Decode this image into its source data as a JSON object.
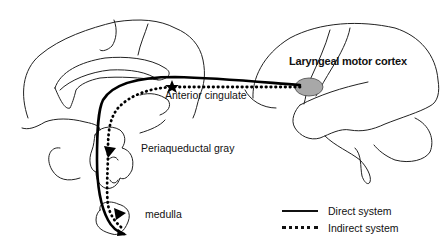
{
  "diagram": {
    "type": "neuroanatomical pathway diagram",
    "labels": {
      "laryngeal_motor_cortex": "Laryngeal motor cortex",
      "anterior_cingulate": "Anterior cingulate",
      "periaqueductal_gray": "Periaqueductal gray",
      "medulla": "medulla"
    },
    "legend": [
      {
        "style": "solid",
        "label": "Direct system"
      },
      {
        "style": "dotted",
        "label": "Indirect system"
      }
    ],
    "colors": {
      "line": "#111111",
      "motor_cortex_fill": "#a8a8a8",
      "background": "#ffffff"
    },
    "nodes": [
      {
        "id": "laryngeal_motor_cortex",
        "shape": "ellipse"
      },
      {
        "id": "anterior_cingulate",
        "shape": "star"
      },
      {
        "id": "periaqueductal_gray",
        "shape": "triangle"
      },
      {
        "id": "medulla",
        "shape": "triangle"
      }
    ],
    "edges": [
      {
        "from": "laryngeal_motor_cortex",
        "to": "medulla",
        "system": "direct",
        "style": "solid"
      },
      {
        "from": "laryngeal_motor_cortex",
        "to": "anterior_cingulate",
        "system": "indirect",
        "style": "dotted"
      },
      {
        "from": "anterior_cingulate",
        "to": "periaqueductal_gray",
        "system": "indirect",
        "style": "dotted"
      },
      {
        "from": "periaqueductal_gray",
        "to": "medulla",
        "system": "indirect",
        "style": "dotted"
      }
    ]
  }
}
